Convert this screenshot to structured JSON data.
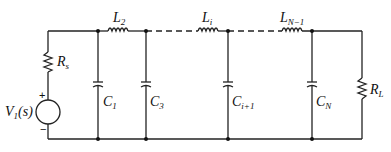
{
  "diagram": {
    "type": "ladder-network-circuit",
    "source": {
      "label": "V",
      "sub": "1",
      "arg": "(s)",
      "plus": "+",
      "minus": "−"
    },
    "source_resistor": {
      "label": "R",
      "sub": "s"
    },
    "load_resistor": {
      "label": "R",
      "sub": "L"
    },
    "inductors": [
      {
        "label": "L",
        "sub": "2"
      },
      {
        "label": "L",
        "sub": "i"
      },
      {
        "label": "L",
        "sub": "N−1"
      }
    ],
    "capacitors": [
      {
        "label": "C",
        "sub": "1"
      },
      {
        "label": "C",
        "sub": "3"
      },
      {
        "label": "C",
        "sub": "i+1"
      },
      {
        "label": "C",
        "sub": "N"
      }
    ]
  }
}
